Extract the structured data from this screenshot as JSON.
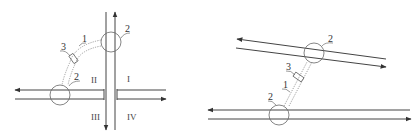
{
  "diagrams": [
    {
      "id": "left",
      "description": "Intersection of vertical and horizontal two-lane roads",
      "labels": {
        "beam": "1",
        "circle_top": "2",
        "circle_bottom": "2",
        "device": "3"
      },
      "quadrants": [
        "I",
        "II",
        "III",
        "IV"
      ]
    },
    {
      "id": "right",
      "description": "Slanted road above a horizontal road",
      "labels": {
        "beam": "1",
        "circle_top": "2",
        "circle_bottom": "2",
        "device": "3"
      }
    }
  ],
  "colors": {
    "line": "#444444",
    "background": "#ffffff"
  }
}
